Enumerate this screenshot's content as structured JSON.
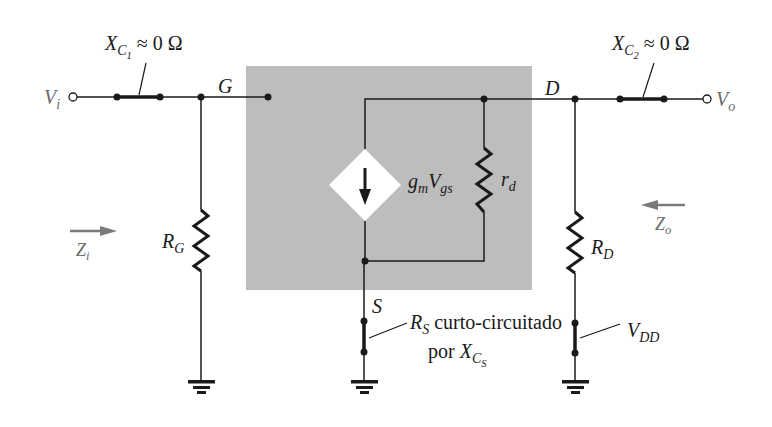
{
  "figure": {
    "type": "small-signal equivalent circuit (JFET common-source, bypassed R_S)",
    "colors": {
      "wire": "#1a1a1a",
      "shaded_box": "#bdbdbd",
      "source_diamond": "#ffffff",
      "arrow_gray": "#7a7a7a",
      "io_label_gray": "#6b6b6b"
    }
  },
  "labels": {
    "vi": {
      "main": "V",
      "sub": "i"
    },
    "vo": {
      "main": "V",
      "sub": "o"
    },
    "xc1": {
      "main": "X",
      "sub": "C",
      "subsub": "1",
      "rest": " ≈ 0 Ω"
    },
    "xc2": {
      "main": "X",
      "sub": "C",
      "subsub": "2",
      "rest": " ≈ 0 Ω"
    },
    "gate": "G",
    "drain": "D",
    "source": "S",
    "rg": {
      "main": "R",
      "sub": "G"
    },
    "rd": {
      "main": "R",
      "sub": "D"
    },
    "r_d": {
      "main": "r",
      "sub": "d"
    },
    "gm": {
      "g": "g",
      "gsub": "m",
      "v": "V",
      "vsub": "gs"
    },
    "zi": {
      "main": "Z",
      "sub": "i"
    },
    "zo": {
      "main": "Z",
      "sub": "o"
    },
    "vdd": {
      "main": "V",
      "sub": "DD"
    },
    "rs_note": {
      "line1_main": "R",
      "line1_sub": "S",
      "line1_rest": " curto-circuitado",
      "line2_pre": "por ",
      "line2_main": "X",
      "line2_sub": "C",
      "line2_subsub": "S"
    }
  }
}
